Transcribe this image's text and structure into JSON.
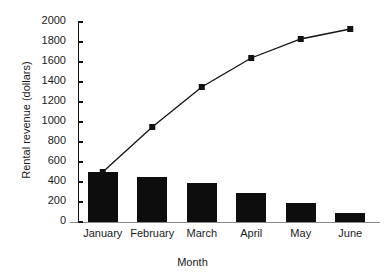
{
  "chart_data": {
    "type": "bar",
    "title": "",
    "subtitle": "",
    "xlabel": "Month",
    "ylabel": "Rental revenue (dollars)",
    "categories": [
      "January",
      "February",
      "March",
      "April",
      "May",
      "June"
    ],
    "ylim": [
      0,
      2000
    ],
    "yticks": [
      0,
      200,
      400,
      600,
      800,
      1000,
      1200,
      1400,
      1600,
      1800,
      2000
    ],
    "ytick_labels": [
      "0",
      "200",
      "400",
      "600",
      "800",
      "1000",
      "1200",
      "1400",
      "1600",
      "1800",
      "2000"
    ],
    "grid": false,
    "legend": false,
    "legend_position": "none",
    "annotations": [],
    "series": [
      {
        "name": "Monthly rental revenue",
        "type": "bar",
        "color": "#0d0d0d",
        "values": [
          500,
          450,
          395,
          290,
          190,
          90
        ]
      },
      {
        "name": "Cumulative rental revenue",
        "type": "line",
        "color": "#111111",
        "marker": "square",
        "values": [
          500,
          950,
          1350,
          1640,
          1830,
          1930
        ]
      }
    ]
  }
}
